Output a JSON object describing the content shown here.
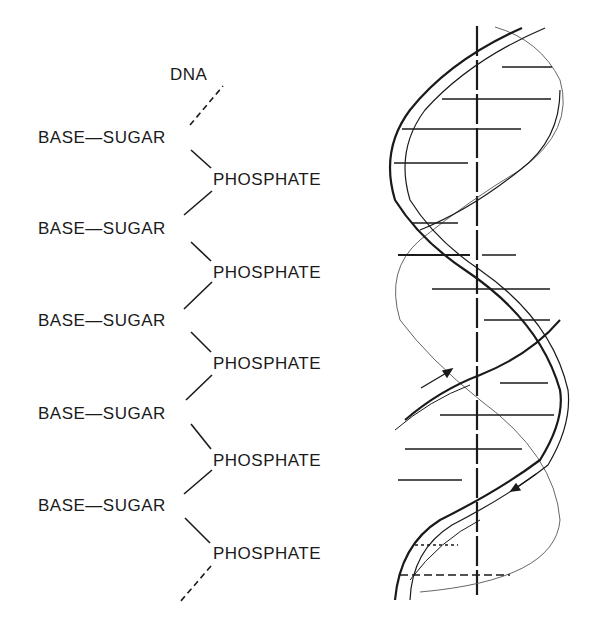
{
  "title": "DNA",
  "chain": {
    "rows": [
      {
        "sugar": "BASE—SUGAR",
        "phosphate": "PHOSPHATE"
      },
      {
        "sugar": "BASE—SUGAR",
        "phosphate": "PHOSPHATE"
      },
      {
        "sugar": "BASE—SUGAR",
        "phosphate": "PHOSPHATE"
      },
      {
        "sugar": "BASE—SUGAR",
        "phosphate": "PHOSPHATE"
      },
      {
        "sugar": "BASE—SUGAR",
        "phosphate": "PHOSPHATE"
      }
    ]
  },
  "helix": {
    "description": "Double helix with base-pair rungs and central axis",
    "arrows": [
      "upward-right strand direction",
      "downward-left strand direction"
    ],
    "stroke_color": "#1a1a1a"
  }
}
